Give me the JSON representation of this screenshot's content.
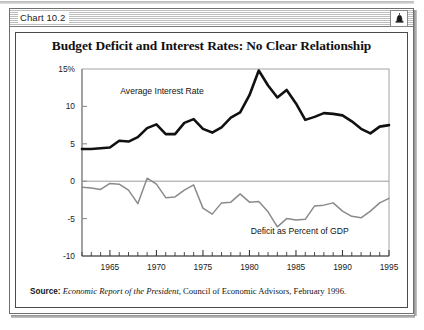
{
  "window": {
    "title": "Chart 10.2",
    "widget_icon": "bell-icon"
  },
  "chart_title": "Budget Deficit and Interest Rates: No Clear Relationship",
  "source": {
    "prefix": "Source:",
    "italic_part": "Economic Report of the President,",
    "rest": " Council of Economic Advisors, February 1996."
  },
  "chart_data": {
    "type": "line",
    "title": "Budget Deficit and Interest Rates: No Clear Relationship",
    "xlabel": "",
    "ylabel": "",
    "xlim": [
      1962,
      1995
    ],
    "ylim": [
      -10,
      15
    ],
    "grid": false,
    "legend_position": "inline-annotation",
    "y_ticks": [
      15,
      10,
      5,
      0,
      -5,
      -10
    ],
    "y_tick_labels": [
      "15%",
      "10",
      "5",
      "0",
      "-5",
      "-10"
    ],
    "x_ticks": [
      1965,
      1970,
      1975,
      1980,
      1985,
      1990,
      1995
    ],
    "x_tick_labels": [
      "1965",
      "1970",
      "1975",
      "1980",
      "1985",
      "1990",
      "1995"
    ],
    "x_minor_tick_step": 1,
    "zero_line": 0,
    "x": [
      1962,
      1963,
      1964,
      1965,
      1966,
      1967,
      1968,
      1969,
      1970,
      1971,
      1972,
      1973,
      1974,
      1975,
      1976,
      1977,
      1978,
      1979,
      1980,
      1981,
      1982,
      1983,
      1984,
      1985,
      1986,
      1987,
      1988,
      1989,
      1990,
      1991,
      1992,
      1993,
      1994,
      1995
    ],
    "series": [
      {
        "name": "Average Interest Rate",
        "color": "#111111",
        "width": 2.6,
        "label_x": 1970.6,
        "label_y": 11.6,
        "values": [
          4.3,
          4.3,
          4.4,
          4.5,
          5.4,
          5.3,
          5.9,
          7.1,
          7.6,
          6.3,
          6.3,
          7.8,
          8.3,
          7.0,
          6.5,
          7.2,
          8.5,
          9.2,
          11.5,
          14.8,
          12.8,
          11.2,
          12.2,
          10.4,
          8.2,
          8.6,
          9.1,
          9.0,
          8.8,
          8.0,
          7.0,
          6.4,
          7.3,
          7.5
        ]
      },
      {
        "name": "Deficit as Percent of GDP",
        "color": "#8a8a8a",
        "width": 1.5,
        "label_x": 1985.4,
        "label_y": -7.1,
        "values": [
          -0.8,
          -0.9,
          -1.1,
          -0.3,
          -0.4,
          -1.2,
          -3.0,
          0.4,
          -0.4,
          -2.2,
          -2.1,
          -1.2,
          -0.5,
          -3.6,
          -4.4,
          -2.9,
          -2.8,
          -1.7,
          -2.8,
          -2.7,
          -4.1,
          -6.1,
          -5.0,
          -5.2,
          -5.1,
          -3.3,
          -3.2,
          -2.9,
          -4.0,
          -4.7,
          -4.9,
          -4.0,
          -2.9,
          -2.3
        ]
      }
    ]
  }
}
